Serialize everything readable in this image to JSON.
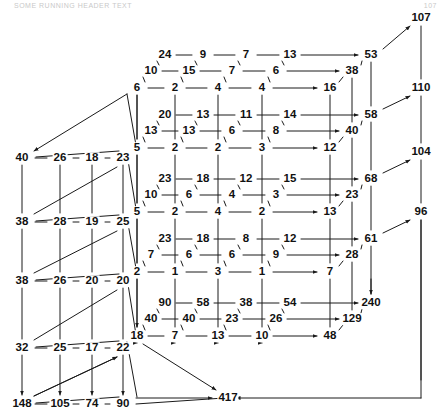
{
  "page": {
    "header_text": "SOME RUNNING HEADER TEXT",
    "page_number": "107",
    "width": 447,
    "height": 420,
    "ink_color": "#111111",
    "line_color": "#1a1a1a"
  },
  "chart_data": {
    "type": "diagram",
    "blocks": [
      {
        "name": "block-1",
        "left_anchor": "6",
        "tiers": [
          {
            "name": "tier-top",
            "values": [
              "24",
              "9",
              "7",
              "13"
            ],
            "total": "53"
          },
          {
            "name": "tier-middle",
            "values": [
              "10",
              "15",
              "7",
              "6"
            ],
            "total": "38"
          },
          {
            "name": "tier-bottom",
            "values": [
              "6",
              "2",
              "4",
              "4"
            ],
            "total": "16"
          }
        ],
        "grand_total": "107"
      },
      {
        "name": "block-2",
        "left_anchor": "5",
        "tiers": [
          {
            "name": "tier-top",
            "values": [
              "20",
              "13",
              "11",
              "14"
            ],
            "total": "58"
          },
          {
            "name": "tier-middle",
            "values": [
              "13",
              "13",
              "6",
              "8"
            ],
            "total": "40"
          },
          {
            "name": "tier-bottom",
            "values": [
              "5",
              "2",
              "2",
              "3"
            ],
            "total": "12"
          }
        ],
        "grand_total": "110"
      },
      {
        "name": "block-3",
        "left_anchor": "5",
        "tiers": [
          {
            "name": "tier-top",
            "values": [
              "23",
              "18",
              "12",
              "15"
            ],
            "total": "68"
          },
          {
            "name": "tier-middle",
            "values": [
              "10",
              "6",
              "4",
              "3"
            ],
            "total": "23"
          },
          {
            "name": "tier-bottom",
            "values": [
              "5",
              "2",
              "4",
              "2"
            ],
            "total": "13"
          }
        ],
        "grand_total": "104"
      },
      {
        "name": "block-4",
        "left_anchor": "2",
        "tiers": [
          {
            "name": "tier-top",
            "values": [
              "23",
              "18",
              "8",
              "12"
            ],
            "total": "61"
          },
          {
            "name": "tier-middle",
            "values": [
              "7",
              "6",
              "6",
              "9"
            ],
            "total": "28"
          },
          {
            "name": "tier-bottom",
            "values": [
              "2",
              "1",
              "3",
              "1"
            ],
            "total": "7"
          }
        ],
        "grand_total": "96"
      },
      {
        "name": "block-5",
        "left_anchor": "18",
        "tiers": [
          {
            "name": "tier-top",
            "values": [
              "90",
              "58",
              "38",
              "54"
            ],
            "total": "240"
          },
          {
            "name": "tier-middle",
            "values": [
              "40",
              "40",
              "23",
              "26"
            ],
            "total": "129"
          },
          {
            "name": "tier-bottom",
            "values": [
              "18",
              "7",
              "13",
              "10"
            ],
            "total": "48"
          }
        ],
        "grand_total": "417"
      }
    ],
    "left_face_rows": [
      {
        "name": "left-row-1",
        "values": [
          "40",
          "26",
          "18",
          "23"
        ]
      },
      {
        "name": "left-row-2",
        "values": [
          "38",
          "28",
          "19",
          "25"
        ]
      },
      {
        "name": "left-row-3",
        "values": [
          "38",
          "26",
          "20",
          "20"
        ]
      },
      {
        "name": "left-row-4",
        "values": [
          "32",
          "25",
          "17",
          "22"
        ]
      },
      {
        "name": "left-row-5",
        "values": [
          "148",
          "105",
          "74",
          "90"
        ]
      }
    ],
    "right_column_totals": [
      "107",
      "110",
      "104",
      "96"
    ],
    "tier_column_totals": [
      [
        "53",
        "38",
        "16"
      ],
      [
        "58",
        "40",
        "12"
      ],
      [
        "68",
        "23",
        "13"
      ],
      [
        "61",
        "28",
        "7"
      ],
      [
        "240",
        "129",
        "48"
      ]
    ],
    "final_total": "417"
  }
}
